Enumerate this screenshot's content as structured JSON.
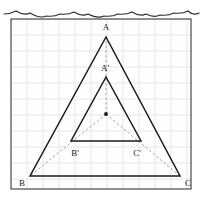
{
  "figure": {
    "kind": "geometry-diagram",
    "canvas": {
      "width": 201,
      "height": 203
    },
    "paper": {
      "background_color": "#ffffff",
      "torn_edge": true,
      "border_color": "#3a3a3a",
      "border_rect": {
        "x": 11,
        "y": 19,
        "width": 180,
        "height": 170
      },
      "grid": {
        "visible": true,
        "cell_size": 16,
        "color": "#f0dede",
        "origin_x": 11,
        "origin_y": 19
      }
    },
    "stroke_colors": {
      "solid": "#1a1a1a",
      "dashed": "#9a9a9a",
      "center_dot": "#1a1a1a"
    },
    "center_point": {
      "name": "center-of-dilation",
      "x": 106,
      "y": 114
    },
    "triangles": [
      {
        "name": "triangle-ABC",
        "style": "solid",
        "vertices": [
          {
            "label": "A",
            "x": 106,
            "y": 37
          },
          {
            "label": "B",
            "x": 30,
            "y": 176
          },
          {
            "label": "C",
            "x": 180,
            "y": 176
          }
        ]
      },
      {
        "name": "triangle-A-prime-B-prime-C-prime",
        "style": "solid",
        "vertices": [
          {
            "label": "A'",
            "x": 106,
            "y": 77
          },
          {
            "label": "B'",
            "x": 71,
            "y": 141
          },
          {
            "label": "C'",
            "x": 141,
            "y": 141
          }
        ]
      }
    ],
    "dashed_rays": [
      {
        "name": "ray-center-to-A",
        "x1": 106,
        "y1": 114,
        "x2": 106,
        "y2": 37
      },
      {
        "name": "ray-center-to-B",
        "x1": 106,
        "y1": 114,
        "x2": 30,
        "y2": 176
      },
      {
        "name": "ray-center-to-C",
        "x1": 106,
        "y1": 114,
        "x2": 180,
        "y2": 176
      }
    ],
    "labels": [
      {
        "name": "vertex-label-A",
        "text": "A",
        "x": 106,
        "y": 30,
        "anchor": "middle"
      },
      {
        "name": "vertex-label-A-prime",
        "text": "A'",
        "x": 105,
        "y": 71,
        "anchor": "middle"
      },
      {
        "name": "vertex-label-B-prime",
        "text": "B'",
        "x": 75,
        "y": 156,
        "anchor": "middle"
      },
      {
        "name": "vertex-label-C-prime",
        "text": "C'",
        "x": 137,
        "y": 156,
        "anchor": "middle"
      },
      {
        "name": "vertex-label-B",
        "text": "B",
        "x": 22,
        "y": 186,
        "anchor": "middle"
      },
      {
        "name": "vertex-label-C",
        "text": "C",
        "x": 188,
        "y": 186,
        "anchor": "middle"
      }
    ]
  }
}
